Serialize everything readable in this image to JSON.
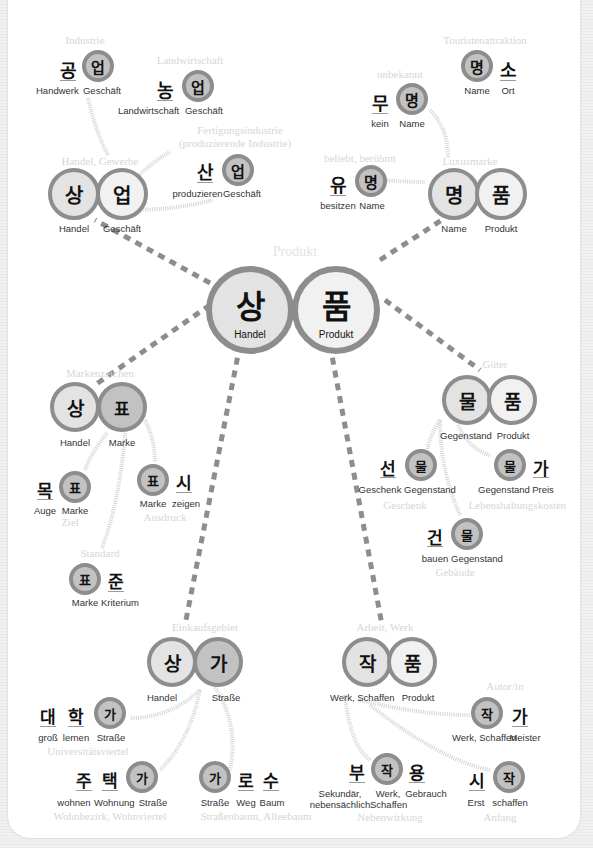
{
  "center": {
    "caption": "Produkt",
    "left": {
      "char": "상",
      "gloss": "Handel"
    },
    "right": {
      "char": "품",
      "gloss": "Produkt"
    }
  },
  "clusters": {
    "sangeop": {
      "caption": "Handel, Gewerbe",
      "left": {
        "char": "상",
        "gloss": "Handel"
      },
      "right": {
        "char": "업",
        "gloss": "Geschäft"
      }
    },
    "gongeop": {
      "caption": "Industrie",
      "a": {
        "char": "공",
        "gloss": "Handwerk"
      },
      "b": {
        "char": "업",
        "gloss": "Geschäft"
      }
    },
    "nongeop": {
      "caption": "Landwirtschaft",
      "a": {
        "char": "농",
        "gloss": "Landwirtschaft"
      },
      "b": {
        "char": "업",
        "gloss": "Geschäft"
      }
    },
    "saneop": {
      "caption1": "Fertigungsindustrie",
      "caption2": "(produzierende Industrie)",
      "a": {
        "char": "산",
        "gloss": "produzieren"
      },
      "b": {
        "char": "업",
        "gloss": "Geschäft"
      }
    },
    "myeongpum": {
      "caption": "Luxusmarke",
      "left": {
        "char": "명",
        "gloss": "Name"
      },
      "right": {
        "char": "품",
        "gloss": "Produkt"
      }
    },
    "myeongso": {
      "caption": "Touristenattraktion",
      "a": {
        "char": "명",
        "gloss": "Name"
      },
      "b": {
        "char": "소",
        "gloss": "Ort"
      }
    },
    "mumyeong": {
      "caption": "unbekannt",
      "a": {
        "char": "무",
        "gloss": "kein"
      },
      "b": {
        "char": "명",
        "gloss": "Name"
      }
    },
    "yumyeong": {
      "caption": "beliebt, berühmt",
      "a": {
        "char": "유",
        "gloss": "besitzen"
      },
      "b": {
        "char": "명",
        "gloss": "Name"
      }
    },
    "sangpyo": {
      "caption": "Markenzeichen",
      "left": {
        "char": "상",
        "gloss": "Handel"
      },
      "right": {
        "char": "표",
        "gloss": "Marke"
      }
    },
    "mokpyo": {
      "caption": "Ziel",
      "a": {
        "char": "목",
        "gloss": "Auge"
      },
      "b": {
        "char": "표",
        "gloss": "Marke"
      }
    },
    "pyosi": {
      "caption": "Ausdruck",
      "a": {
        "char": "표",
        "gloss": "Marke"
      },
      "b": {
        "char": "시",
        "gloss": "zeigen"
      }
    },
    "pyojun": {
      "caption": "Standard",
      "a": {
        "char": "표",
        "gloss": "Marke"
      },
      "b": {
        "char": "준",
        "gloss": "Kriterium"
      }
    },
    "mulpum": {
      "caption": "Güter",
      "left": {
        "char": "물",
        "gloss": "Gegenstand"
      },
      "right": {
        "char": "품",
        "gloss": "Produkt"
      }
    },
    "seonmul": {
      "caption": "Geschenk",
      "a": {
        "char": "선",
        "gloss": "Geschenk"
      },
      "b": {
        "char": "물",
        "gloss": "Gegenstand"
      }
    },
    "mulga": {
      "caption": "Lebenshaltungskosten",
      "a": {
        "char": "물",
        "gloss": "Gegenstand"
      },
      "b": {
        "char": "가",
        "gloss": "Preis"
      }
    },
    "geonmul": {
      "caption": "Gebäude",
      "a": {
        "char": "건",
        "gloss": "bauen"
      },
      "b": {
        "char": "물",
        "gloss": "Gegenstand"
      }
    },
    "sangga": {
      "caption": "Einkaufsgebiet",
      "left": {
        "char": "상",
        "gloss": "Handel"
      },
      "right": {
        "char": "가",
        "gloss": "Straße"
      }
    },
    "daehakga": {
      "caption": "Universitätsviertel",
      "a": {
        "char": "대",
        "gloss": "groß"
      },
      "b": {
        "char": "학",
        "gloss": "lernen"
      },
      "c": {
        "char": "가",
        "gloss": "Straße"
      }
    },
    "jutaekga": {
      "caption": "Wohnbezirk, Wohnviertel",
      "a": {
        "char": "주",
        "gloss": "wohnen"
      },
      "b": {
        "char": "택",
        "gloss": "Wohnung"
      },
      "c": {
        "char": "가",
        "gloss": "Straße"
      }
    },
    "garosu": {
      "caption": "Straßenbaum, Alleebaum",
      "a": {
        "char": "가",
        "gloss": "Straße"
      },
      "b": {
        "char": "로",
        "gloss": "Weg"
      },
      "c": {
        "char": "수",
        "gloss": "Baum"
      }
    },
    "jakpum": {
      "caption": "Arbeit, Werk",
      "left": {
        "char": "작",
        "gloss": "Werk, Schaffen"
      },
      "right": {
        "char": "품",
        "gloss": "Produkt"
      }
    },
    "jakga": {
      "caption": "Autor/in",
      "a": {
        "char": "작",
        "gloss": "Werk, Schaffen"
      },
      "b": {
        "char": "가",
        "gloss": "Meister"
      }
    },
    "bujakyong": {
      "caption": "Nebenwirkung",
      "a": {
        "char": "부",
        "gloss": "Sekundär, nebensächlich"
      },
      "b": {
        "char": "작",
        "gloss": "Werk, Schaffen"
      },
      "c": {
        "char": "용",
        "gloss": "Gebrauch"
      }
    },
    "sijak": {
      "caption": "Anfang",
      "a": {
        "char": "시",
        "gloss": "Erst"
      },
      "b": {
        "char": "작",
        "gloss": "schaffen"
      }
    }
  }
}
